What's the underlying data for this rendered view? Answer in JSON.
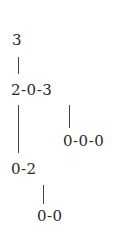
{
  "diagram": {
    "type": "tree",
    "nodes": [
      {
        "id": "n1",
        "label": "3"
      },
      {
        "id": "n2",
        "label": "2-0-3"
      },
      {
        "id": "n3",
        "label": "0-0-0"
      },
      {
        "id": "n4",
        "label": "0-2"
      },
      {
        "id": "n5",
        "label": "0-0"
      }
    ],
    "edges": [
      {
        "from": "n1",
        "to": "n2"
      },
      {
        "from": "n2",
        "to": "n3"
      },
      {
        "from": "n2",
        "to": "n4"
      },
      {
        "from": "n4",
        "to": "n5"
      }
    ]
  }
}
